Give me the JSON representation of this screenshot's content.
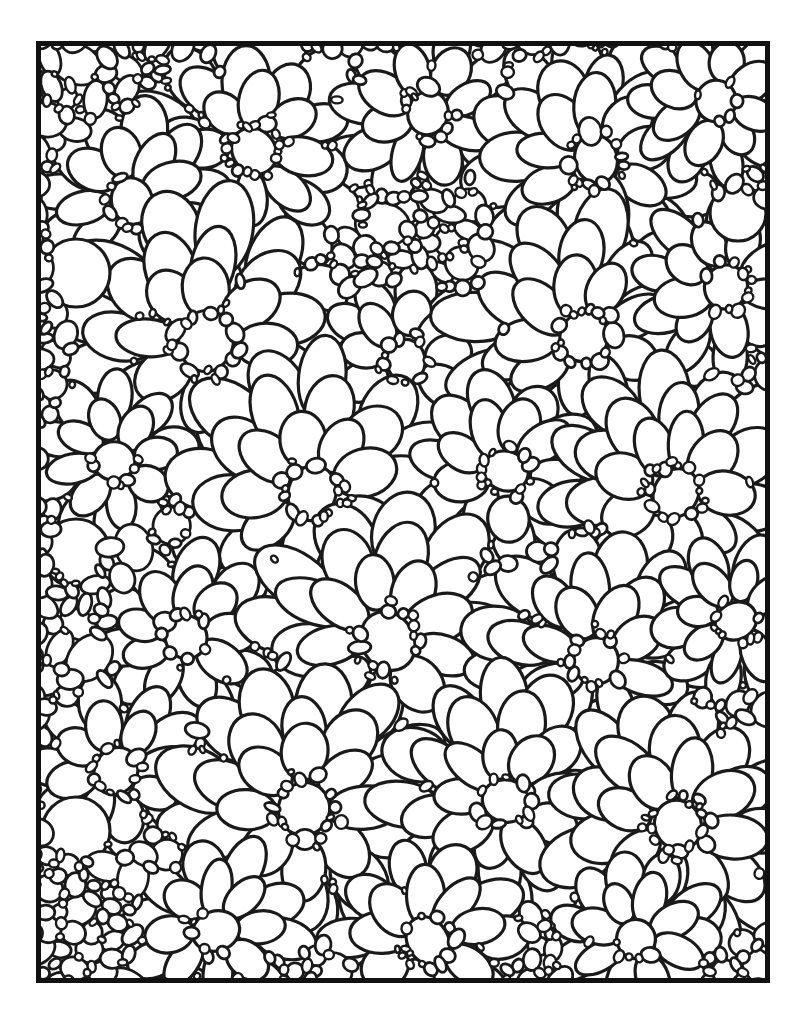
{
  "document": {
    "kind": "coloring-book-page",
    "title": "Flower Pattern Coloring Page",
    "page_width": 799,
    "page_height": 1016,
    "background_color": "#ffffff",
    "ink_color": "#1a1a1a",
    "margin_color": "#ffffff"
  },
  "frame": {
    "name": "page-border",
    "x": 36,
    "y": 41,
    "width": 734,
    "height": 942,
    "stroke_width": 5,
    "stroke_color": "#111111",
    "fill": "none"
  },
  "artwork": {
    "name": "flower-pattern",
    "description": "Dense all-over pattern of overlapping rounded petal shapes forming layered daisy-like flower clusters",
    "line_color": "#1a1a1a",
    "line_width": 3.2,
    "fill_color": "#ffffff",
    "viewbox": "0 0 734 942",
    "seed": 20240517,
    "petal_stroke": 3.2,
    "filler_stroke": 2.8,
    "clusters": [
      {
        "name": "flower-cluster",
        "cx": 218,
        "cy": 110,
        "r_core": 26,
        "rings": 3,
        "rot": 12
      },
      {
        "name": "flower-cluster",
        "cx": 392,
        "cy": 72,
        "r_core": 24,
        "rings": 2,
        "rot": 40
      },
      {
        "name": "flower-cluster",
        "cx": 560,
        "cy": 118,
        "r_core": 27,
        "rings": 3,
        "rot": 70
      },
      {
        "name": "flower-cluster",
        "cx": 680,
        "cy": 60,
        "r_core": 22,
        "rings": 2,
        "rot": 20
      },
      {
        "name": "flower-cluster",
        "cx": 96,
        "cy": 160,
        "r_core": 25,
        "rings": 2,
        "rot": 55
      },
      {
        "name": "flower-cluster",
        "cx": 170,
        "cy": 300,
        "r_core": 30,
        "rings": 3,
        "rot": 5
      },
      {
        "name": "flower-cluster",
        "cx": 370,
        "cy": 320,
        "r_core": 24,
        "rings": 2,
        "rot": 33
      },
      {
        "name": "flower-cluster",
        "cx": 548,
        "cy": 296,
        "r_core": 28,
        "rings": 3,
        "rot": 62
      },
      {
        "name": "flower-cluster",
        "cx": 690,
        "cy": 246,
        "r_core": 24,
        "rings": 2,
        "rot": 15
      },
      {
        "name": "flower-cluster",
        "cx": 78,
        "cy": 420,
        "r_core": 22,
        "rings": 2,
        "rot": 48
      },
      {
        "name": "flower-cluster",
        "cx": 276,
        "cy": 452,
        "r_core": 30,
        "rings": 3,
        "rot": 25
      },
      {
        "name": "flower-cluster",
        "cx": 470,
        "cy": 430,
        "r_core": 25,
        "rings": 2,
        "rot": 78
      },
      {
        "name": "flower-cluster",
        "cx": 640,
        "cy": 452,
        "r_core": 28,
        "rings": 3,
        "rot": 8
      },
      {
        "name": "flower-cluster",
        "cx": 150,
        "cy": 596,
        "r_core": 24,
        "rings": 2,
        "rot": 36
      },
      {
        "name": "flower-cluster",
        "cx": 352,
        "cy": 600,
        "r_core": 30,
        "rings": 3,
        "rot": 58
      },
      {
        "name": "flower-cluster",
        "cx": 560,
        "cy": 620,
        "r_core": 26,
        "rings": 3,
        "rot": 18
      },
      {
        "name": "flower-cluster",
        "cx": 700,
        "cy": 580,
        "r_core": 22,
        "rings": 2,
        "rot": 66
      },
      {
        "name": "flower-cluster",
        "cx": 80,
        "cy": 730,
        "r_core": 24,
        "rings": 2,
        "rot": 44
      },
      {
        "name": "flower-cluster",
        "cx": 268,
        "cy": 768,
        "r_core": 30,
        "rings": 3,
        "rot": 10
      },
      {
        "name": "flower-cluster",
        "cx": 470,
        "cy": 760,
        "r_core": 26,
        "rings": 3,
        "rot": 72
      },
      {
        "name": "flower-cluster",
        "cx": 642,
        "cy": 784,
        "r_core": 28,
        "rings": 3,
        "rot": 28
      },
      {
        "name": "flower-cluster",
        "cx": 180,
        "cy": 890,
        "r_core": 24,
        "rings": 2,
        "rot": 52
      },
      {
        "name": "flower-cluster",
        "cx": 392,
        "cy": 900,
        "r_core": 26,
        "rings": 2,
        "rot": 30
      },
      {
        "name": "flower-cluster",
        "cx": 600,
        "cy": 898,
        "r_core": 22,
        "rings": 2,
        "rot": 64
      }
    ],
    "big_circles": [
      {
        "name": "plain-circle",
        "cx": 40,
        "cy": 232,
        "r": 34
      },
      {
        "name": "plain-circle",
        "cx": 40,
        "cy": 512,
        "r": 34
      },
      {
        "name": "plain-circle",
        "cx": 40,
        "cy": 790,
        "r": 34
      },
      {
        "name": "plain-circle",
        "cx": 702,
        "cy": 172,
        "r": 28
      }
    ],
    "filler_density": 1.0
  }
}
